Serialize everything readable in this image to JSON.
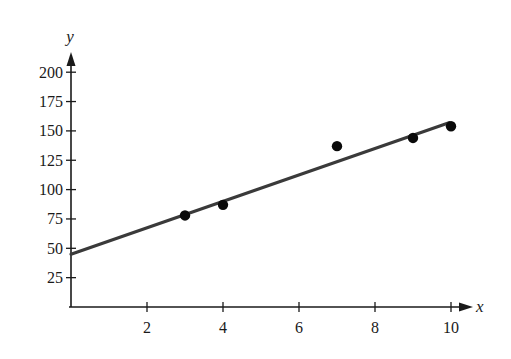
{
  "chart_data": {
    "type": "scatter",
    "title": "",
    "xlabel": "x",
    "ylabel": "y",
    "xlim": [
      0,
      10.5
    ],
    "ylim": [
      0,
      210
    ],
    "grid": false,
    "legend": null,
    "x_ticks": [
      2,
      4,
      6,
      8,
      10
    ],
    "y_ticks": [
      25,
      50,
      75,
      100,
      125,
      150,
      175,
      200
    ],
    "series": [
      {
        "name": "data points",
        "type": "scatter",
        "points": [
          {
            "x": 3,
            "y": 78
          },
          {
            "x": 4,
            "y": 87
          },
          {
            "x": 7,
            "y": 137
          },
          {
            "x": 9,
            "y": 144
          },
          {
            "x": 10,
            "y": 154
          }
        ]
      },
      {
        "name": "regression line",
        "type": "line",
        "intercept": 45,
        "slope": 11.2,
        "points": [
          {
            "x": 0,
            "y": 45
          },
          {
            "x": 10,
            "y": 157
          }
        ]
      }
    ]
  },
  "colors": {
    "ink": "#1a1a1a",
    "line": "#3a3a3a",
    "background": "#ffffff"
  }
}
